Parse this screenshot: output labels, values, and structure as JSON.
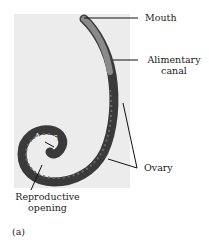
{
  "figure": {
    "panel_label": "(a)",
    "labels": {
      "mouth": "Mouth",
      "alimentary_canal_line1": "Alimentary",
      "alimentary_canal_line2": "canal",
      "ovary": "Ovary",
      "anus": "Anus",
      "reproductive_opening_line1": "Reproductive",
      "reproductive_opening_line2": "opening"
    },
    "colors": {
      "background": "#ffffff",
      "photo_backdrop": "#ececec",
      "worm_body": "#3a3a3a",
      "worm_light": "#8a8a8a",
      "leader_lines": "#111111"
    }
  }
}
